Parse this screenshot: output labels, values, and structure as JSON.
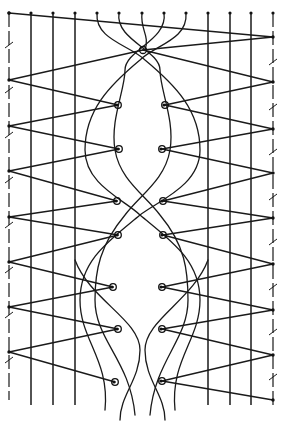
{
  "diagram": {
    "title": "",
    "colors": {
      "ink": "#1a1a1a",
      "paper": "#ffffff"
    },
    "top_pins_x": [
      9,
      31,
      53,
      75,
      97,
      119,
      142,
      164,
      186,
      208,
      230,
      251,
      273
    ],
    "top_pins_y": 13,
    "passives_left_x": [
      31,
      53,
      75
    ],
    "passives_right_x": [
      208,
      230,
      251
    ],
    "edge_left_x": 9,
    "edge_right_x": 273,
    "edge_pins_left_y": [
      13,
      80,
      126,
      171,
      217,
      262,
      307,
      352
    ],
    "edge_pins_right_y": [
      37,
      82,
      129,
      173,
      218,
      264,
      310,
      355,
      400
    ],
    "top_center_pin": {
      "x": 143,
      "y": 50
    },
    "inner_pins_left": [
      [
        118,
        105
      ],
      [
        119,
        149
      ],
      [
        117,
        201
      ],
      [
        118,
        235
      ],
      [
        113,
        287
      ],
      [
        118,
        329
      ],
      [
        115,
        382
      ]
    ],
    "inner_pins_right": [
      [
        165,
        105
      ],
      [
        162,
        149
      ],
      [
        163,
        201
      ],
      [
        163,
        235
      ],
      [
        162,
        287
      ],
      [
        162,
        329
      ],
      [
        162,
        381
      ]
    ]
  }
}
